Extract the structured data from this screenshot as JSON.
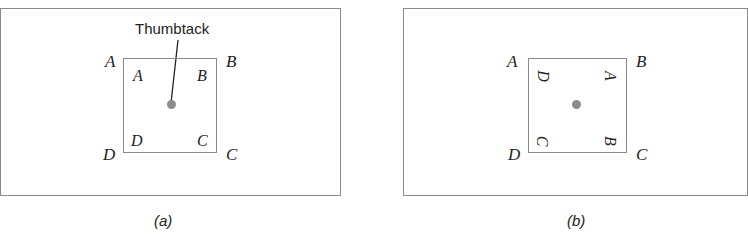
{
  "figure": {
    "panel_a": {
      "caption": "(a)",
      "pointer_label": "Thumbtack",
      "outer_corner_labels": {
        "tl": "A",
        "tr": "B",
        "bl": "D",
        "br": "C"
      },
      "inner_corner_labels": {
        "tl": "A",
        "tr": "B",
        "bl": "D",
        "br": "C"
      },
      "inner_rotation_deg": 0
    },
    "panel_b": {
      "caption": "(b)",
      "outer_corner_labels": {
        "tl": "A",
        "tr": "B",
        "bl": "D",
        "br": "C"
      },
      "inner_corner_labels": {
        "tl": "D",
        "tr": "A",
        "bl": "C",
        "br": "B"
      },
      "inner_rotation_deg": 90
    },
    "colors": {
      "line": "#8a8a8a",
      "dot": "#8c8c8c",
      "text": "#222222"
    }
  }
}
